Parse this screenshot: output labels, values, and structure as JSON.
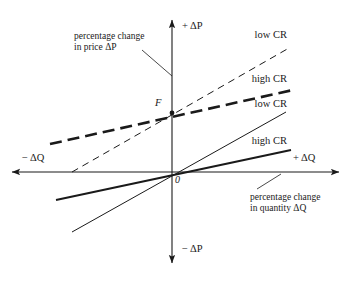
{
  "figure": {
    "type": "diagram",
    "background_color": "#ffffff",
    "line_color": "#1a1a1a"
  },
  "axes": {
    "origin_label": "0",
    "origin_x": 172,
    "origin_y": 172,
    "vertical": {
      "positive_label": "+ ΔP",
      "negative_label": "− ΔP",
      "top_y": 18,
      "bottom_y": 265
    },
    "horizontal": {
      "positive_label": "+ ΔQ",
      "negative_label": "− ΔQ",
      "left_x": 10,
      "right_x": 341
    }
  },
  "points": [
    {
      "name": "F",
      "label": "F",
      "x": 172,
      "y": 113
    }
  ],
  "captions": [
    {
      "name": "price-caption",
      "line1": "percentage change",
      "line2": "in price ΔP",
      "text_x": 74,
      "text_y": 31,
      "leader": {
        "x1": 142,
        "y1": 50,
        "x2": 172,
        "y2": 76
      }
    },
    {
      "name": "quantity-caption",
      "line1": "percentage change",
      "line2": "in quantity ΔQ",
      "text_x": 250,
      "text_y": 192,
      "leader": {
        "x1": 281,
        "y1": 174,
        "x2": 257,
        "y2": 189
      }
    }
  ],
  "curves": [
    {
      "name": "low-cr-dashed",
      "label": "low CR",
      "style": "dashed",
      "weight": "thin",
      "dash_pattern": "7,5",
      "stroke_width": 1.0,
      "x1": 72,
      "y1": 172,
      "x2": 289,
      "y2": 48,
      "label_x": 287,
      "label_y": 29
    },
    {
      "name": "high-cr-dashed",
      "label": "high CR",
      "style": "dashed",
      "weight": "thick",
      "dash_pattern": "12,6",
      "stroke_width": 2.6,
      "x1": 50,
      "y1": 144,
      "x2": 293,
      "y2": 90,
      "label_x": 287,
      "label_y": 73
    },
    {
      "name": "low-cr-solid",
      "label": "low CR",
      "style": "solid",
      "weight": "thin",
      "stroke_width": 1.0,
      "x1": 72,
      "y1": 232,
      "x2": 286,
      "y2": 112,
      "label_x": 287,
      "label_y": 98
    },
    {
      "name": "high-cr-solid",
      "label": "high CR",
      "style": "solid",
      "weight": "thick",
      "stroke_width": 2.0,
      "x1": 56,
      "y1": 200,
      "x2": 291,
      "y2": 150,
      "label_x": 287,
      "label_y": 135
    }
  ]
}
